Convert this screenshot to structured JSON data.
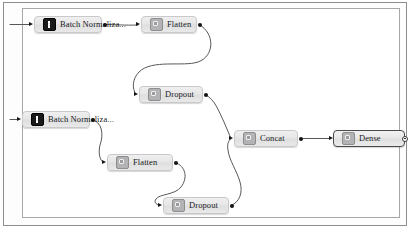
{
  "canvas": {
    "background_color": "#ffffff",
    "border_color": "#a8a8a8",
    "frame_color": "#8d8d8d"
  },
  "graph": {
    "nodes": [
      {
        "id": "batchnorm-top",
        "label": "Batch Normaliza...",
        "icon": "batch-normalization-icon",
        "icon_style": "dark",
        "selected": false,
        "x": 34,
        "y": 16,
        "width": 68
      },
      {
        "id": "flatten-top",
        "label": "Flatten",
        "icon": "flatten-icon",
        "icon_style": "gray",
        "selected": false,
        "x": 141,
        "y": 16,
        "width": 56
      },
      {
        "id": "dropout-top",
        "label": "Dropout",
        "icon": "dropout-icon",
        "icon_style": "gray",
        "selected": false,
        "x": 139,
        "y": 86,
        "width": 64
      },
      {
        "id": "batchnorm-bottom",
        "label": "Batch Normaliza...",
        "icon": "batch-normalization-icon",
        "icon_style": "dark",
        "selected": false,
        "x": 22,
        "y": 111,
        "width": 68
      },
      {
        "id": "flatten-bottom",
        "label": "Flatten",
        "icon": "flatten-icon",
        "icon_style": "gray",
        "selected": false,
        "x": 107,
        "y": 154,
        "width": 66
      },
      {
        "id": "dropout-bottom",
        "label": "Dropout",
        "icon": "dropout-icon",
        "icon_style": "gray",
        "selected": false,
        "x": 163,
        "y": 197,
        "width": 66
      },
      {
        "id": "concat",
        "label": "Concat",
        "icon": "concat-icon",
        "icon_style": "gray",
        "selected": false,
        "x": 234,
        "y": 130,
        "width": 64
      },
      {
        "id": "dense",
        "label": "Dense",
        "icon": "dense-icon",
        "icon_style": "gray",
        "selected": true,
        "x": 333,
        "y": 130,
        "width": 72
      }
    ],
    "edges": [
      {
        "id": "edge-in-batchnorm-top",
        "from": "canvas-left-edge",
        "to": "batchnorm-top"
      },
      {
        "id": "edge-batchnorm-top-flatten-top",
        "from": "batchnorm-top",
        "to": "flatten-top"
      },
      {
        "id": "edge-flatten-top-dropout-top",
        "from": "flatten-top",
        "to": "dropout-top"
      },
      {
        "id": "edge-dropout-top-concat",
        "from": "dropout-top",
        "to": "concat"
      },
      {
        "id": "edge-in-batchnorm-bottom",
        "from": "canvas-left-edge",
        "to": "batchnorm-bottom"
      },
      {
        "id": "edge-batchnorm-bottom-flatten-bottom",
        "from": "batchnorm-bottom",
        "to": "flatten-bottom"
      },
      {
        "id": "edge-flatten-bottom-dropout-bottom",
        "from": "flatten-bottom",
        "to": "dropout-bottom"
      },
      {
        "id": "edge-dropout-bottom-concat",
        "from": "dropout-bottom",
        "to": "concat"
      },
      {
        "id": "edge-concat-dense",
        "from": "concat",
        "to": "dense"
      }
    ]
  }
}
